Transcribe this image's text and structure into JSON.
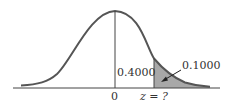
{
  "diagram": {
    "type": "normal-distribution",
    "mean_label": "0",
    "z_label": "z = ?",
    "center_area_label": "0.4000",
    "tail_area_label": "0.1000",
    "colors": {
      "curve": "#555555",
      "shade": "#a8a8a8",
      "axis": "#444444"
    }
  }
}
